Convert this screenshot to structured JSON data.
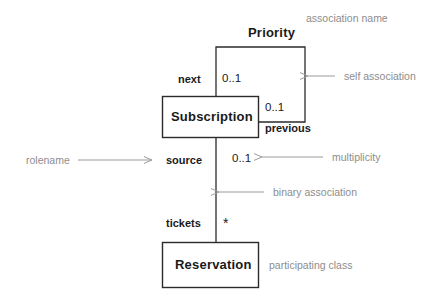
{
  "diagram": {
    "type": "uml-class-diagram",
    "classes": [
      {
        "id": "subscription",
        "name": "Subscription",
        "x": 162,
        "y": 96,
        "w": 97,
        "h": 42
      },
      {
        "id": "reservation",
        "name": "Reservation",
        "x": 162,
        "y": 242,
        "w": 97,
        "h": 46
      }
    ],
    "association_name": "Priority",
    "roles": {
      "next": "next",
      "previous": "previous",
      "source": "source",
      "tickets": "tickets"
    },
    "multiplicities": {
      "next": "0..1",
      "previous": "0..1",
      "source": "0..1",
      "tickets": "*"
    },
    "annotations": {
      "association_name": "association name",
      "self_association": "self association",
      "rolename": "rolename",
      "multiplicity": "multiplicity",
      "binary_association": "binary association",
      "participating_class": "participating class"
    },
    "colors": {
      "line": "#2b2b2b",
      "text": "#1a1a1a",
      "annotation": "#8d8d8d",
      "background": "#ffffff"
    }
  }
}
